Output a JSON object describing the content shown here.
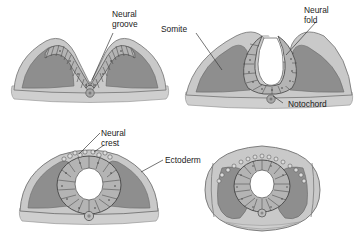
{
  "figure": {
    "background_color": "#ffffff"
  },
  "palette": {
    "ectoderm": "#c9c9c9",
    "ectoderm_edge": "#8f8f8f",
    "mesoderm": "#8e8e8e",
    "mesoderm_edge": "#6d6d6d",
    "neural_cells": "#b4b4b4",
    "neural_cell_line": "#4a4a4a",
    "endoderm": "#cfcfcf",
    "lumen": "#ffffff",
    "notochord": "#a8a8a8",
    "outline": "#5a5a5a",
    "label_text": "#1b1b1b",
    "leader_line": "#3a3a3a"
  },
  "panels": [
    {
      "id": "panel-neural-groove",
      "stage": "Neural groove stage",
      "position": "top-left",
      "labels": [
        {
          "name": "neural-groove",
          "lines": [
            "Neural",
            "groove"
          ]
        }
      ]
    },
    {
      "id": "panel-neural-fold",
      "stage": "Neural fold stage",
      "position": "top-right",
      "labels": [
        {
          "name": "somite",
          "lines": [
            "Somite"
          ]
        },
        {
          "name": "neural-fold",
          "lines": [
            "Neural",
            "fold"
          ]
        },
        {
          "name": "notochord",
          "lines": [
            "Notochord"
          ]
        }
      ]
    },
    {
      "id": "panel-neural-tube",
      "stage": "Closed neural tube stage",
      "position": "bottom-left",
      "labels": [
        {
          "name": "neural-crest",
          "lines": [
            "Neural",
            "crest"
          ]
        },
        {
          "name": "ectoderm",
          "lines": [
            "Ectoderm"
          ]
        }
      ]
    },
    {
      "id": "panel-crest-migration",
      "stage": "Neural crest migration stage",
      "position": "bottom-right",
      "labels": []
    }
  ],
  "labels": {
    "neural_groove_line1": "Neural",
    "neural_groove_line2": "groove",
    "somite": "Somite",
    "neural_fold_line1": "Neural",
    "neural_fold_line2": "fold",
    "notochord": "Notochord",
    "neural_crest_line1": "Neural",
    "neural_crest_line2": "crest",
    "ectoderm": "Ectoderm"
  }
}
